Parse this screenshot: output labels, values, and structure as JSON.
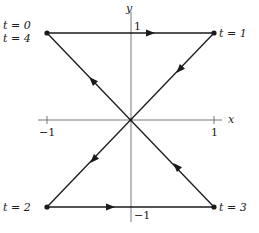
{
  "diagram": {
    "colors": {
      "stroke": "#1a1a1a",
      "axis": "#555555",
      "background": "#ffffff"
    },
    "axes": {
      "x_label": "x",
      "y_label": "y",
      "x_ticks": [
        {
          "value": "−1"
        },
        {
          "value": "1"
        }
      ],
      "y_ticks": [
        {
          "value": "1"
        },
        {
          "value": "−1"
        }
      ]
    },
    "points": [
      {
        "label_top": "t = 0",
        "label_bottom": "t = 4",
        "coords": [
          -1,
          1
        ]
      },
      {
        "label": "t = 1",
        "coords": [
          1,
          1
        ]
      },
      {
        "label": "t = 2",
        "coords": [
          -1,
          -1
        ]
      },
      {
        "label": "t = 3",
        "coords": [
          1,
          -1
        ]
      }
    ],
    "path_segments": [
      {
        "from": "t = 0",
        "to": "t = 1",
        "direction": "right"
      },
      {
        "from": "t = 1",
        "to": "origin",
        "direction": "down-left"
      },
      {
        "from": "origin",
        "to": "t = 2",
        "direction": "down-left"
      },
      {
        "from": "t = 2",
        "to": "t = 3",
        "direction": "right"
      },
      {
        "from": "t = 3",
        "to": "origin",
        "direction": "up-left"
      },
      {
        "from": "origin",
        "to": "t = 4",
        "direction": "up-left"
      }
    ]
  }
}
